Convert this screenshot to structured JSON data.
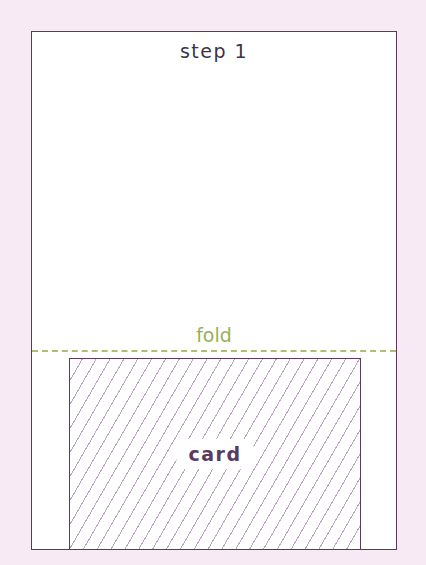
{
  "diagram": {
    "title": "step 1",
    "fold_label": "fold",
    "card_label": "card",
    "colors": {
      "background": "#f7eaf4",
      "outline": "#5a3a5e",
      "fold": "#9aae5a",
      "hatch": "#b9a8bd"
    }
  }
}
